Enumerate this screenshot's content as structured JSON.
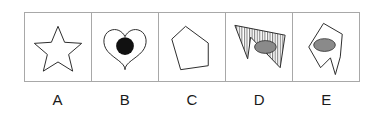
{
  "puzzle": {
    "type": "odd-one-out-shape-puzzle",
    "option_count": 5,
    "colors": {
      "background": "#ffffff",
      "border": "#a8a8a8",
      "outline": "#2b2b2b",
      "fill_black": "#111111",
      "fill_gray": "#8a8a8a",
      "label_text": "#1a1a1a"
    },
    "options": [
      {
        "label": "A",
        "shape_name": "five-pointed-star",
        "description": "Five-pointed star outline",
        "filled": false,
        "hatched": false,
        "inner_marks": []
      },
      {
        "label": "B",
        "shape_name": "heart",
        "description": "Heart outline containing a solid black circle",
        "filled": false,
        "hatched": false,
        "inner_marks": [
          {
            "mark": "circle",
            "fill": "#111111"
          }
        ]
      },
      {
        "label": "C",
        "shape_name": "irregular-pentagon",
        "description": "Irregular pentagon outline, empty",
        "filled": false,
        "hatched": false,
        "inner_marks": []
      },
      {
        "label": "D",
        "shape_name": "zigzag-polygon",
        "description": "Tilted zigzag polygon with vertical hatching containing a gray ellipse",
        "filled": false,
        "hatched": true,
        "inner_marks": [
          {
            "mark": "ellipse",
            "fill": "#8a8a8a"
          }
        ]
      },
      {
        "label": "E",
        "shape_name": "notched-polygon",
        "description": "Irregular notched polygon outline containing a gray ellipse",
        "filled": false,
        "hatched": false,
        "inner_marks": [
          {
            "mark": "ellipse",
            "fill": "#8a8a8a"
          }
        ]
      }
    ]
  }
}
